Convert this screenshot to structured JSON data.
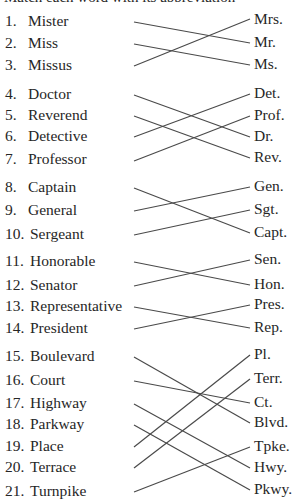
{
  "header": {
    "cut_off_text": "Match each word with its abbreviation"
  },
  "line_color": "#4a4a4a",
  "text_color": "#262626",
  "groups": [
    {
      "left": [
        {
          "num": "1.",
          "word": "Mister",
          "y": 22
        },
        {
          "num": "2.",
          "word": "Miss",
          "y": 44
        },
        {
          "num": "3.",
          "word": "Missus",
          "y": 66
        }
      ],
      "right": [
        {
          "abbr": "Mrs.",
          "y": 20
        },
        {
          "abbr": "Mr.",
          "y": 43
        },
        {
          "abbr": "Ms.",
          "y": 65
        }
      ]
    },
    {
      "left": [
        {
          "num": "4.",
          "word": "Doctor",
          "y": 95
        },
        {
          "num": "5.",
          "word": "Reverend",
          "y": 116
        },
        {
          "num": "6.",
          "word": "Detective",
          "y": 137
        },
        {
          "num": "7.",
          "word": "Professor",
          "y": 160
        }
      ],
      "right": [
        {
          "abbr": "Det.",
          "y": 94
        },
        {
          "abbr": "Prof.",
          "y": 116
        },
        {
          "abbr": "Dr.",
          "y": 137
        },
        {
          "abbr": "Rev.",
          "y": 158
        }
      ]
    },
    {
      "left": [
        {
          "num": "8.",
          "word": "Captain",
          "y": 188
        },
        {
          "num": "9.",
          "word": "General",
          "y": 211
        },
        {
          "num": "10.",
          "word": "Sergeant",
          "y": 235
        }
      ],
      "right": [
        {
          "abbr": "Gen.",
          "y": 187
        },
        {
          "abbr": "Sgt.",
          "y": 210
        },
        {
          "abbr": "Capt.",
          "y": 233
        }
      ]
    },
    {
      "left": [
        {
          "num": "11.",
          "word": "Honorable",
          "y": 262
        },
        {
          "num": "12.",
          "word": "Senator",
          "y": 286
        },
        {
          "num": "13.",
          "word": "Representative",
          "y": 307
        },
        {
          "num": "14.",
          "word": "President",
          "y": 329
        }
      ],
      "right": [
        {
          "abbr": "Sen.",
          "y": 260
        },
        {
          "abbr": "Hon.",
          "y": 285
        },
        {
          "abbr": "Pres.",
          "y": 305
        },
        {
          "abbr": "Rep.",
          "y": 328
        }
      ]
    },
    {
      "left": [
        {
          "num": "15.",
          "word": "Boulevard",
          "y": 357
        },
        {
          "num": "16.",
          "word": "Court",
          "y": 381
        },
        {
          "num": "17.",
          "word": "Highway",
          "y": 404
        },
        {
          "num": "18.",
          "word": "Parkway",
          "y": 425
        },
        {
          "num": "19.",
          "word": "Place",
          "y": 447
        },
        {
          "num": "20.",
          "word": "Terrace",
          "y": 468
        },
        {
          "num": "21.",
          "word": "Turnpike",
          "y": 492
        }
      ],
      "right": [
        {
          "abbr": "Pl.",
          "y": 355
        },
        {
          "abbr": "Terr.",
          "y": 379
        },
        {
          "abbr": "Ct.",
          "y": 403
        },
        {
          "abbr": "Blvd.",
          "y": 423
        },
        {
          "abbr": "Tpke.",
          "y": 447
        },
        {
          "abbr": "Hwy.",
          "y": 468
        },
        {
          "abbr": "Pkwy.",
          "y": 490
        }
      ]
    }
  ],
  "connections": [
    {
      "from": "Mister",
      "to": "Mr.",
      "y1": 22,
      "y2": 43
    },
    {
      "from": "Miss",
      "to": "Ms.",
      "y1": 44,
      "y2": 65
    },
    {
      "from": "Missus",
      "to": "Mrs.",
      "y1": 66,
      "y2": 19
    },
    {
      "from": "Doctor",
      "to": "Dr.",
      "y1": 95,
      "y2": 137
    },
    {
      "from": "Reverend",
      "to": "Rev.",
      "y1": 116,
      "y2": 158
    },
    {
      "from": "Detective",
      "to": "Det.",
      "y1": 137,
      "y2": 94
    },
    {
      "from": "Professor",
      "to": "Prof.",
      "y1": 161,
      "y2": 116
    },
    {
      "from": "Captain",
      "to": "Capt.",
      "y1": 188,
      "y2": 233
    },
    {
      "from": "General",
      "to": "Gen.",
      "y1": 211,
      "y2": 187
    },
    {
      "from": "Sergeant",
      "to": "Sgt.",
      "y1": 235,
      "y2": 210
    },
    {
      "from": "Honorable",
      "to": "Hon.",
      "y1": 262,
      "y2": 285
    },
    {
      "from": "Senator",
      "to": "Sen.",
      "y1": 286,
      "y2": 260
    },
    {
      "from": "Representative",
      "to": "Rep.",
      "y1": 307,
      "y2": 328
    },
    {
      "from": "President",
      "to": "Pres.",
      "y1": 329,
      "y2": 305
    },
    {
      "from": "Boulevard",
      "to": "Blvd.",
      "y1": 357,
      "y2": 423
    },
    {
      "from": "Court",
      "to": "Ct.",
      "y1": 381,
      "y2": 403
    },
    {
      "from": "Highway",
      "to": "Hwy.",
      "y1": 404,
      "y2": 468
    },
    {
      "from": "Parkway",
      "to": "Pkwy.",
      "y1": 425,
      "y2": 490
    },
    {
      "from": "Place",
      "to": "Pl.",
      "y1": 447,
      "y2": 355
    },
    {
      "from": "Terrace",
      "to": "Terr.",
      "y1": 468,
      "y2": 379
    },
    {
      "from": "Turnpike",
      "to": "Tpke.",
      "y1": 492,
      "y2": 447
    }
  ],
  "line_x1": 134,
  "line_x2": 250
}
